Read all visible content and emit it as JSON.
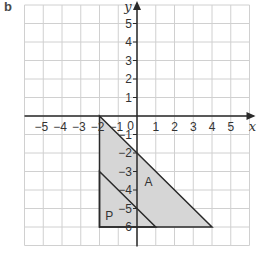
{
  "part_label": "b",
  "axes": {
    "x_label": "x",
    "y_label": "y",
    "x_ticks": [
      "-5",
      "-4",
      "-3",
      "-2",
      "-1",
      "1",
      "2",
      "3",
      "4",
      "5"
    ],
    "y_ticks": [
      "5",
      "4",
      "3",
      "2",
      "1",
      "-1",
      "-2",
      "-3",
      "-4",
      "-5",
      "-6"
    ],
    "origin_label": "0",
    "x_range": [
      -6,
      6
    ],
    "y_range": [
      -7,
      6
    ]
  },
  "shapes": {
    "A": {
      "label": "A",
      "vertices": [
        [
          -2,
          0
        ],
        [
          4,
          -6
        ],
        [
          -2,
          -6
        ]
      ]
    },
    "P": {
      "label": "P",
      "vertices": [
        [
          -2,
          -3
        ],
        [
          1,
          -6
        ],
        [
          -2,
          -6
        ]
      ]
    }
  },
  "colors": {
    "grid": "#d0d0d0",
    "fill": "#d6d6d6",
    "line": "#2a2a2a"
  }
}
